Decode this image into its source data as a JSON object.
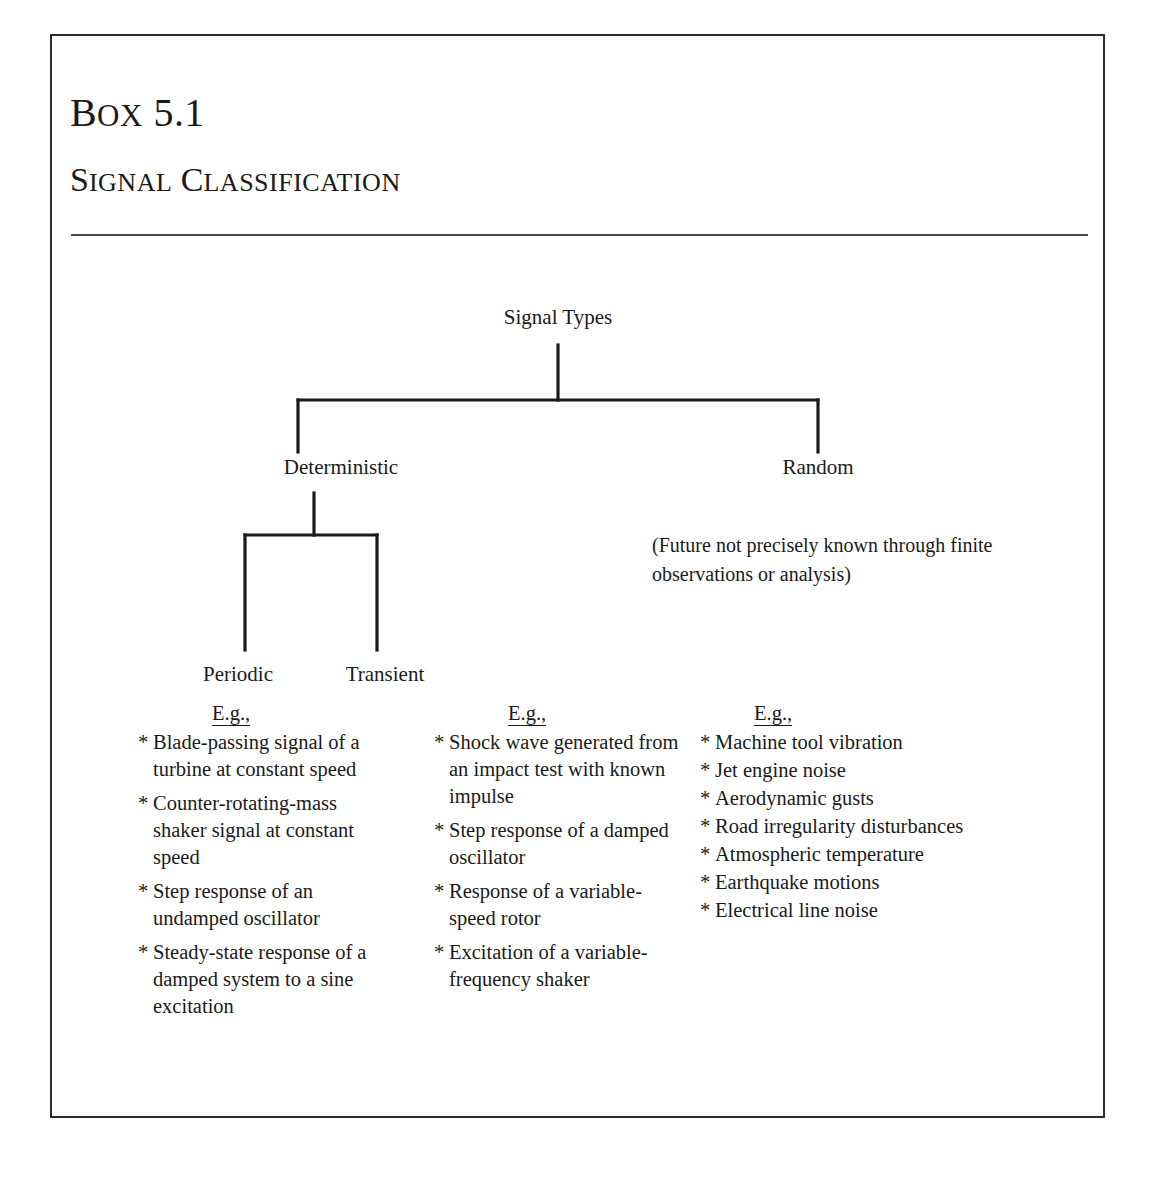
{
  "box": {
    "number": "Box 5.1",
    "title": "Signal Classification"
  },
  "tree": {
    "root": "Signal Types",
    "deterministic": "Deterministic",
    "random": "Random",
    "periodic": "Periodic",
    "transient": "Transient",
    "random_note": "(Future not precisely known through finite observations or analysis)"
  },
  "examples": {
    "heading": "E.g.,",
    "bullet": "*",
    "columns": [
      {
        "for": "periodic",
        "items": [
          "Blade-passing signal of a turbine at constant speed",
          "Counter-rotating-mass shaker signal at constant speed",
          "Step response of an undamped oscillator",
          "Steady-state response of a damped system to a sine excitation"
        ]
      },
      {
        "for": "transient",
        "items": [
          "Shock wave generated from an impact test with known impulse",
          "Step response of a damped oscillator",
          "Response of a variable-speed rotor",
          "Excitation of a variable-frequency shaker"
        ]
      },
      {
        "for": "random",
        "items": [
          "Machine tool vibration",
          "Jet engine noise",
          "Aerodynamic gusts",
          "Road irregularity disturbances",
          "Atmospheric temperature",
          "Earthquake motions",
          "Electrical line noise"
        ]
      }
    ]
  },
  "colors": {
    "ink": "#1a1a1a",
    "frame": "#2b2b2b",
    "rule": "#4a4a4a",
    "page": "#ffffff"
  }
}
